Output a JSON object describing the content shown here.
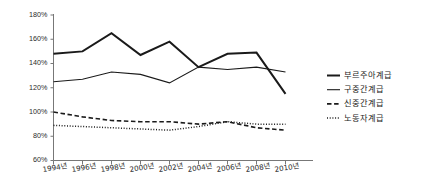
{
  "chart_data": {
    "type": "line",
    "title": "",
    "subtitle": "",
    "xlabel": "",
    "ylabel": "",
    "x": [
      "1994년",
      "1996년",
      "1998년",
      "2000년",
      "2002년",
      "2004년",
      "2006년",
      "2008년",
      "2010년"
    ],
    "categories": [
      "1994년",
      "1996년",
      "1998년",
      "2000년",
      "2002년",
      "2004년",
      "2006년",
      "2008년",
      "2010년"
    ],
    "ylim": [
      60,
      180
    ],
    "ytick_labels": [
      "180%",
      "160%",
      "140%",
      "120%",
      "100%",
      "80%",
      "60%"
    ],
    "ytick_values": [
      180,
      160,
      140,
      120,
      100,
      80,
      60
    ],
    "grid": false,
    "legend_position": "right",
    "series": [
      {
        "name": "부르주아계급",
        "style": "solid-thick",
        "color": "#1a1a1a",
        "values": [
          148,
          150,
          165,
          147,
          158,
          137,
          148,
          149,
          115
        ]
      },
      {
        "name": "구중간계급",
        "style": "solid-thin",
        "color": "#1a1a1a",
        "values": [
          125,
          127,
          133,
          131,
          124,
          137,
          135,
          137,
          133
        ]
      },
      {
        "name": "신중간계급",
        "style": "dashed",
        "color": "#1a1a1a",
        "values": [
          100,
          96,
          93,
          92,
          92,
          90,
          92,
          87,
          85
        ]
      },
      {
        "name": "노동자계급",
        "style": "dotted",
        "color": "#1a1a1a",
        "values": [
          89,
          88,
          87,
          86,
          85,
          88,
          92,
          90,
          90
        ]
      }
    ]
  },
  "legend": {
    "entries": [
      {
        "label": "부르주아계급"
      },
      {
        "label": "구중간계급"
      },
      {
        "label": "신중간계급"
      },
      {
        "label": "노동자계급"
      }
    ]
  },
  "axes": {
    "y": {
      "labels": [
        "180%",
        "160%",
        "140%",
        "120%",
        "100%",
        "80%",
        "60%"
      ]
    },
    "x": {
      "labels": [
        "1994년",
        "1996년",
        "1998년",
        "2000년",
        "2002년",
        "2004년",
        "2006년",
        "2008년",
        "2010년"
      ]
    }
  }
}
